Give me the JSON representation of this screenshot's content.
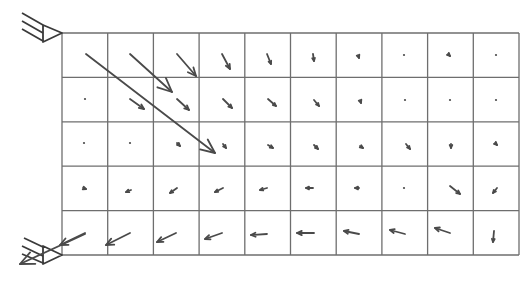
{
  "diagram": {
    "type": "vector-field-mesh",
    "colors": {
      "grid": "#6e6e6e",
      "arrow": "#4a4a4a",
      "support": "#3a3a3a",
      "background": "#ffffff"
    },
    "grid": {
      "x0": 62,
      "y0": 33,
      "x1": 519,
      "y1": 255,
      "columns": 10,
      "rows": 5
    },
    "supports": [
      {
        "name": "top-pin-support",
        "apex": [
          62,
          33
        ],
        "base_x": 43,
        "base_y0": 25,
        "base_y1": 42,
        "hatch": [
          [
            [
              22,
              13
            ],
            [
              43,
              25
            ]
          ],
          [
            [
              22,
              21
            ],
            [
              43,
              33
            ]
          ],
          [
            [
              22,
              29
            ],
            [
              43,
              41
            ]
          ]
        ]
      },
      {
        "name": "bottom-pin-support",
        "apex": [
          62,
          255
        ],
        "base_x": 43,
        "base_y0": 246,
        "base_y1": 264,
        "hatch": [
          [
            [
              24,
              238
            ],
            [
              43,
              247
            ]
          ],
          [
            [
              22,
              246
            ],
            [
              43,
              256
            ]
          ],
          [
            [
              22,
              254
            ],
            [
              43,
              263
            ]
          ]
        ]
      }
    ],
    "reaction_arrows": [
      {
        "from": [
          85,
          234
        ],
        "to": [
          20,
          264
        ]
      }
    ],
    "arrows": [
      {
        "row": 1,
        "col": 1,
        "from": [
          86,
          54
        ],
        "to": [
          215,
          153
        ]
      },
      {
        "row": 1,
        "col": 2,
        "from": [
          130,
          54
        ],
        "to": [
          172,
          92
        ]
      },
      {
        "row": 1,
        "col": 3,
        "from": [
          177,
          54
        ],
        "to": [
          196,
          76
        ]
      },
      {
        "row": 1,
        "col": 4,
        "from": [
          222,
          54
        ],
        "to": [
          230,
          69
        ]
      },
      {
        "row": 1,
        "col": 5,
        "from": [
          267,
          54
        ],
        "to": [
          271,
          64
        ]
      },
      {
        "row": 1,
        "col": 6,
        "from": [
          313,
          54
        ],
        "to": [
          314,
          61
        ]
      },
      {
        "row": 1,
        "col": 7,
        "from": [
          358,
          55
        ],
        "to": [
          359,
          58
        ]
      },
      {
        "row": 1,
        "col": 8,
        "from": [
          404,
          55
        ],
        "to": [
          404,
          56
        ]
      },
      {
        "row": 1,
        "col": 9,
        "from": [
          448,
          54
        ],
        "to": [
          450,
          56
        ]
      },
      {
        "row": 1,
        "col": 10,
        "from": [
          496,
          55
        ],
        "to": [
          496,
          56
        ]
      },
      {
        "row": 2,
        "col": 1,
        "from": [
          85,
          99
        ],
        "to": [
          85,
          100
        ]
      },
      {
        "row": 2,
        "col": 2,
        "from": [
          130,
          99
        ],
        "to": [
          144,
          109
        ]
      },
      {
        "row": 2,
        "col": 3,
        "from": [
          177,
          99
        ],
        "to": [
          189,
          110
        ]
      },
      {
        "row": 2,
        "col": 4,
        "from": [
          223,
          99
        ],
        "to": [
          232,
          108
        ]
      },
      {
        "row": 2,
        "col": 5,
        "from": [
          268,
          99
        ],
        "to": [
          276,
          106
        ]
      },
      {
        "row": 2,
        "col": 6,
        "from": [
          314,
          100
        ],
        "to": [
          319,
          106
        ]
      },
      {
        "row": 2,
        "col": 7,
        "from": [
          360,
          100
        ],
        "to": [
          361,
          103
        ]
      },
      {
        "row": 2,
        "col": 8,
        "from": [
          405,
          100
        ],
        "to": [
          405,
          101
        ]
      },
      {
        "row": 2,
        "col": 9,
        "from": [
          450,
          100
        ],
        "to": [
          450,
          101
        ]
      },
      {
        "row": 2,
        "col": 10,
        "from": [
          496,
          100
        ],
        "to": [
          496,
          101
        ]
      },
      {
        "row": 3,
        "col": 1,
        "from": [
          84,
          143
        ],
        "to": [
          84,
          144
        ]
      },
      {
        "row": 3,
        "col": 2,
        "from": [
          130,
          143
        ],
        "to": [
          130,
          144
        ]
      },
      {
        "row": 3,
        "col": 3,
        "from": [
          177,
          143
        ],
        "to": [
          180,
          146
        ]
      },
      {
        "row": 3,
        "col": 4,
        "from": [
          223,
          144
        ],
        "to": [
          226,
          148
        ]
      },
      {
        "row": 3,
        "col": 5,
        "from": [
          268,
          145
        ],
        "to": [
          273,
          148
        ]
      },
      {
        "row": 3,
        "col": 6,
        "from": [
          314,
          145
        ],
        "to": [
          318,
          149
        ]
      },
      {
        "row": 3,
        "col": 7,
        "from": [
          360,
          146
        ],
        "to": [
          363,
          148
        ]
      },
      {
        "row": 3,
        "col": 8,
        "from": [
          406,
          144
        ],
        "to": [
          410,
          149
        ]
      },
      {
        "row": 3,
        "col": 9,
        "from": [
          451,
          144
        ],
        "to": [
          451,
          148
        ]
      },
      {
        "row": 3,
        "col": 10,
        "from": [
          495,
          143
        ],
        "to": [
          497,
          145
        ]
      },
      {
        "row": 4,
        "col": 1,
        "from": [
          83,
          188
        ],
        "to": [
          86,
          189
        ]
      },
      {
        "row": 4,
        "col": 2,
        "from": [
          131,
          190
        ],
        "to": [
          126,
          192
        ]
      },
      {
        "row": 4,
        "col": 3,
        "from": [
          177,
          188
        ],
        "to": [
          170,
          193
        ]
      },
      {
        "row": 4,
        "col": 4,
        "from": [
          223,
          188
        ],
        "to": [
          215,
          192
        ]
      },
      {
        "row": 4,
        "col": 5,
        "from": [
          267,
          188
        ],
        "to": [
          260,
          190
        ]
      },
      {
        "row": 4,
        "col": 6,
        "from": [
          313,
          188
        ],
        "to": [
          306,
          188
        ]
      },
      {
        "row": 4,
        "col": 7,
        "from": [
          359,
          188
        ],
        "to": [
          355,
          188
        ]
      },
      {
        "row": 4,
        "col": 8,
        "from": [
          404,
          188
        ],
        "to": [
          404,
          189
        ]
      },
      {
        "row": 4,
        "col": 9,
        "from": [
          450,
          186
        ],
        "to": [
          460,
          194
        ]
      },
      {
        "row": 4,
        "col": 10,
        "from": [
          497,
          188
        ],
        "to": [
          493,
          193
        ]
      },
      {
        "row": 5,
        "col": 1,
        "from": [
          85,
          233
        ],
        "to": [
          60,
          245
        ]
      },
      {
        "row": 5,
        "col": 2,
        "from": [
          130,
          233
        ],
        "to": [
          106,
          245
        ]
      },
      {
        "row": 5,
        "col": 3,
        "from": [
          176,
          233
        ],
        "to": [
          157,
          242
        ]
      },
      {
        "row": 5,
        "col": 4,
        "from": [
          222,
          233
        ],
        "to": [
          205,
          239
        ]
      },
      {
        "row": 5,
        "col": 5,
        "from": [
          267,
          234
        ],
        "to": [
          251,
          235
        ]
      },
      {
        "row": 5,
        "col": 6,
        "from": [
          314,
          233
        ],
        "to": [
          297,
          233
        ]
      },
      {
        "row": 5,
        "col": 7,
        "from": [
          359,
          234
        ],
        "to": [
          344,
          231
        ]
      },
      {
        "row": 5,
        "col": 8,
        "from": [
          405,
          234
        ],
        "to": [
          390,
          230
        ]
      },
      {
        "row": 5,
        "col": 9,
        "from": [
          450,
          233
        ],
        "to": [
          435,
          228
        ]
      },
      {
        "row": 5,
        "col": 10,
        "from": [
          494,
          231
        ],
        "to": [
          493,
          242
        ]
      }
    ]
  }
}
